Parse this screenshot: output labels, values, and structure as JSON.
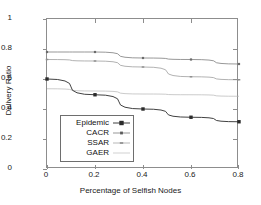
{
  "chart_data": {
    "type": "line",
    "title": "",
    "xlabel": "Percentage of Selfish Nodes",
    "ylabel": "Delivery Ratio",
    "x": [
      0,
      0.2,
      0.4,
      0.6,
      0.8
    ],
    "xlim": [
      0,
      0.8
    ],
    "ylim": [
      0,
      1
    ],
    "xticks": [
      "0",
      "0.2",
      "0.4",
      "0.6",
      "0.8"
    ],
    "yticks": [
      "0",
      "0.2",
      "0.4",
      "0.6",
      "0.8",
      "1"
    ],
    "grid": false,
    "legend_position": "lower-left-inside",
    "series": [
      {
        "name": "Epidemic",
        "values": [
          0.6,
          0.495,
          0.4,
          0.345,
          0.315
        ],
        "color": "#2b2b2b",
        "marker": "filled-square",
        "marker_size": 3.4,
        "line_width": 0.9
      },
      {
        "name": "CACR",
        "values": [
          0.78,
          0.78,
          0.74,
          0.73,
          0.7
        ],
        "color": "#6b6b6b",
        "marker": "small-square",
        "marker_size": 2.2,
        "line_width": 0.7
      },
      {
        "name": "SSAR",
        "values": [
          0.73,
          0.72,
          0.68,
          0.615,
          0.595
        ],
        "color": "#909090",
        "marker": "tiny-dash",
        "marker_size": 1.5,
        "line_width": 0.7
      },
      {
        "name": "GAER",
        "values": [
          0.535,
          0.52,
          0.5,
          0.495,
          0.485
        ],
        "color": "#b4b4b4",
        "marker": "none",
        "marker_size": 0,
        "line_width": 0.7
      }
    ]
  },
  "axis": {
    "x_title": "Percentage of Selfish Nodes",
    "y_title": "Delivery Ratio",
    "x_tick_labels": [
      "0",
      "0.2",
      "0.4",
      "0.6",
      "0.8"
    ],
    "y_tick_labels": [
      "0",
      "0.2",
      "0.4",
      "0.6",
      "0.8",
      "1"
    ]
  },
  "legend": {
    "entries": [
      {
        "label": "Epidemic"
      },
      {
        "label": "CACR"
      },
      {
        "label": "SSAR"
      },
      {
        "label": "GAER"
      }
    ]
  },
  "style": {
    "frame_color": "#8d8d8d",
    "background": "#ffffff",
    "text_color": "#1a1a1a"
  }
}
